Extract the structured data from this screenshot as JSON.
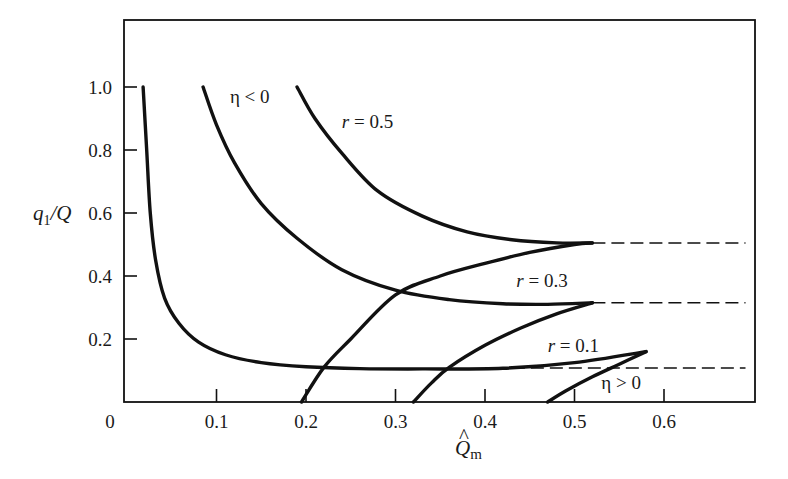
{
  "chart_data": {
    "type": "line",
    "title": "",
    "xlabel": "Q̂m",
    "ylabel": "q1/Q",
    "xlim": [
      0,
      0.7
    ],
    "ylim": [
      0,
      1.18
    ],
    "grid": false,
    "legend": null,
    "x_ticks": [
      {
        "value": 0.1,
        "label": "0.1"
      },
      {
        "value": 0.2,
        "label": "0.2"
      },
      {
        "value": 0.3,
        "label": "0.3"
      },
      {
        "value": 0.4,
        "label": "0.4"
      },
      {
        "value": 0.5,
        "label": "0.5"
      },
      {
        "value": 0.6,
        "label": "0.6"
      }
    ],
    "origin_label": "0",
    "y_ticks": [
      {
        "value": 0.2,
        "label": "0.2"
      },
      {
        "value": 0.4,
        "label": "0.4"
      },
      {
        "value": 0.6,
        "label": "0.6"
      },
      {
        "value": 0.8,
        "label": "0.8"
      },
      {
        "value": 1.0,
        "label": "1.0"
      }
    ],
    "series": [
      {
        "name": "r = 0.1, η < 0",
        "style": "solid",
        "x": [
          0.018,
          0.022,
          0.026,
          0.032,
          0.042,
          0.058,
          0.08,
          0.11,
          0.15,
          0.2,
          0.26,
          0.33,
          0.42,
          0.5,
          0.58
        ],
        "y": [
          1.0,
          0.8,
          0.6,
          0.45,
          0.33,
          0.25,
          0.19,
          0.15,
          0.125,
          0.112,
          0.106,
          0.105,
          0.107,
          0.125,
          0.16
        ]
      },
      {
        "name": "r = 0.3, η < 0",
        "style": "solid",
        "x": [
          0.085,
          0.1,
          0.12,
          0.15,
          0.19,
          0.24,
          0.3,
          0.36,
          0.42,
          0.47,
          0.52
        ],
        "y": [
          1.0,
          0.88,
          0.76,
          0.63,
          0.52,
          0.42,
          0.355,
          0.325,
          0.312,
          0.31,
          0.315
        ]
      },
      {
        "name": "r = 0.5, η < 0",
        "style": "solid",
        "x": [
          0.19,
          0.21,
          0.24,
          0.28,
          0.33,
          0.38,
          0.43,
          0.48,
          0.52
        ],
        "y": [
          1.0,
          0.9,
          0.79,
          0.67,
          0.59,
          0.54,
          0.515,
          0.505,
          0.505
        ]
      },
      {
        "name": "r = 0.5, η > 0",
        "style": "solid",
        "x": [
          0.195,
          0.22,
          0.25,
          0.3,
          0.35,
          0.4,
          0.45,
          0.5,
          0.52
        ],
        "y": [
          0.0,
          0.11,
          0.2,
          0.34,
          0.4,
          0.44,
          0.475,
          0.5,
          0.505
        ]
      },
      {
        "name": "r = 0.3, η > 0",
        "style": "solid",
        "x": [
          0.32,
          0.34,
          0.36,
          0.4,
          0.44,
          0.48,
          0.52
        ],
        "y": [
          0.0,
          0.06,
          0.11,
          0.18,
          0.235,
          0.28,
          0.315
        ]
      },
      {
        "name": "r = 0.1, η > 0",
        "style": "solid",
        "x": [
          0.47,
          0.49,
          0.52,
          0.55,
          0.58
        ],
        "y": [
          0.0,
          0.035,
          0.08,
          0.12,
          0.16
        ]
      },
      {
        "name": "r = 0.5 asymptote",
        "style": "dashed",
        "x": [
          0.52,
          0.7
        ],
        "y": [
          0.505,
          0.505
        ]
      },
      {
        "name": "r = 0.3 asymptote",
        "style": "dashed",
        "x": [
          0.52,
          0.7
        ],
        "y": [
          0.315,
          0.315
        ]
      },
      {
        "name": "r = 0.1 asymptote",
        "style": "dashed",
        "x": [
          0.43,
          0.7
        ],
        "y": [
          0.108,
          0.108
        ]
      }
    ],
    "annotations": [
      {
        "text": "η < 0",
        "x": 0.115,
        "y": 0.95
      },
      {
        "text": "r = 0.5",
        "x": 0.24,
        "y": 0.87
      },
      {
        "text": "r = 0.3",
        "x": 0.435,
        "y": 0.365
      },
      {
        "text": "r = 0.1",
        "x": 0.47,
        "y": 0.16
      },
      {
        "text": "η > 0",
        "x": 0.53,
        "y": 0.04
      }
    ]
  },
  "labels": {
    "xlabel_main": "Q",
    "xlabel_hat": "^",
    "xlabel_sub": "m",
    "ylabel_main": "q",
    "ylabel_sub": "1",
    "ylabel_tail": "/Q"
  }
}
